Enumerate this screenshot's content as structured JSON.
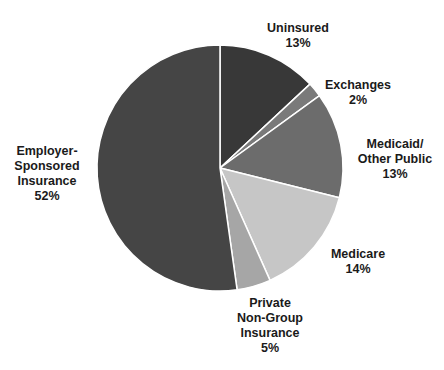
{
  "chart_data": {
    "type": "pie",
    "title": "",
    "start_angle_deg": 0,
    "direction": "clockwise",
    "slices": [
      {
        "label": "Uninsured",
        "display": "Uninsured\n13%",
        "value": 13,
        "angle_start": 0,
        "angle_end": 47,
        "color": "#383838"
      },
      {
        "label": "Exchanges",
        "display": "Exchanges\n2%",
        "value": 2,
        "angle_start": 47,
        "angle_end": 54,
        "color": "#7a7a7a"
      },
      {
        "label": "Medicaid/Other Public",
        "display": "Medicaid/\nOther Public\n13%",
        "value": 13,
        "angle_start": 54,
        "angle_end": 104,
        "color": "#6c6c6c"
      },
      {
        "label": "Medicare",
        "display": "Medicare\n14%",
        "value": 14,
        "angle_start": 104,
        "angle_end": 156,
        "color": "#c6c6c6"
      },
      {
        "label": "Private Non-Group Insurance",
        "display": "Private\nNon-Group\nInsurance\n5%",
        "value": 5,
        "angle_start": 156,
        "angle_end": 172,
        "color": "#a6a6a6"
      },
      {
        "label": "Employer-Sponsored Insurance",
        "display": "Employer-\nSponsored\nInsurance\n52%",
        "value": 52,
        "angle_start": 172,
        "angle_end": 360,
        "color": "#454545"
      }
    ],
    "legend": "none (direct labels)"
  },
  "labels": {
    "uninsured": "Uninsured\n13%",
    "exchanges": "Exchanges\n2%",
    "medicaid": "Medicaid/\nOther Public\n13%",
    "medicare": "Medicare\n14%",
    "private": "Private\nNon-Group\nInsurance\n5%",
    "employer": "Employer-\nSponsored\nInsurance\n52%"
  }
}
